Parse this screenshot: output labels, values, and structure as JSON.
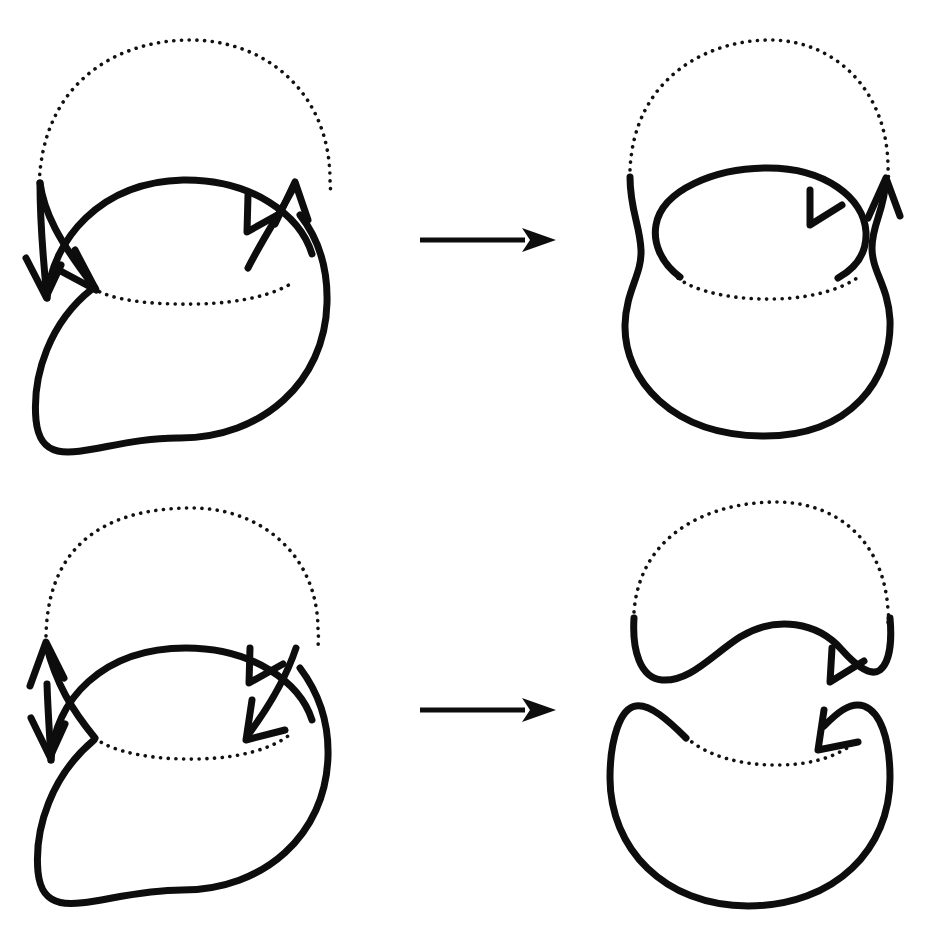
{
  "figure": {
    "background_color": "#ffffff",
    "stroke_color": "#0d0d0d",
    "dotted_stroke_color": "#111111",
    "width": 925,
    "height": 925,
    "solid_stroke_width": 7,
    "dotted_stroke_width": 3.6
  },
  "panels": [
    {
      "id": "top-left",
      "role": "before",
      "row": 1,
      "column": 1,
      "description": "Two overlapping circles forming a link diagram with two crossings; the lower-left arc of the upper circle and the whole lower circle are solid, the upper arc of the upper circle and the inner upper arc of the lower circle are dotted. Four arrowheads mark orientations at the two crossing regions.",
      "crossings": 2,
      "components": 2,
      "arrow_count": 4,
      "arrow_directions": [
        "down-left",
        "down-right",
        "up-left",
        "up"
      ],
      "upper_circle": {
        "cx": 185,
        "cy": 185,
        "r": 150,
        "dotted_arc": "upper"
      },
      "lower_circle": {
        "cx": 180,
        "cy": 292,
        "r": 148,
        "dotted_arc": "inner-upper"
      }
    },
    {
      "id": "top-right",
      "role": "after",
      "row": 1,
      "column": 2,
      "description": "Result of smoothing both crossings in the oriented (Seifert) way: the two strands merge into one outer boundary curve and one inner lens-shaped curve, with no crossings remaining.",
      "crossings": 0,
      "components": 2,
      "arrow_count": 2,
      "arrow_directions": [
        "up-left",
        "up"
      ]
    },
    {
      "id": "bottom-left",
      "role": "before",
      "row": 2,
      "column": 1,
      "description": "Same two overlapping circles but with the opposite orientation on one component: arrowheads point up-left and down-left at the left crossing, and up-left and down-right at the right crossing.",
      "crossings": 2,
      "components": 2,
      "arrow_count": 4,
      "arrow_directions": [
        "up-left",
        "down",
        "up-left",
        "down-right"
      ],
      "upper_circle": {
        "cx": 185,
        "cy": 655,
        "r": 150,
        "dotted_arc": "upper"
      },
      "lower_circle": {
        "cx": 180,
        "cy": 762,
        "r": 148,
        "dotted_arc": "inner-upper"
      }
    },
    {
      "id": "bottom-right",
      "role": "after",
      "row": 2,
      "column": 2,
      "description": "Result of the opposite smoothing: the diagram splits into two disjoint crescent-shaped components, an upper wave-shaped cap and a lower crescent, with no crossings remaining.",
      "crossings": 0,
      "components": 2,
      "arrow_count": 2,
      "arrow_directions": [
        "up-left",
        "down-left"
      ]
    }
  ],
  "map_arrows": [
    {
      "id": "top-map-arrow",
      "label": "⟶",
      "from_panel": "top-left",
      "to_panel": "top-right",
      "x1": 420,
      "y1": 240,
      "x2": 545,
      "y2": 240
    },
    {
      "id": "bottom-map-arrow",
      "label": "⟶",
      "from_panel": "bottom-left",
      "to_panel": "bottom-right",
      "x1": 420,
      "y1": 710,
      "x2": 545,
      "y2": 710
    }
  ],
  "chart_data": {
    "type": "diagram",
    "rows": 2,
    "columns": 2,
    "relation": "left panel maps to right panel via a long right arrow"
  }
}
